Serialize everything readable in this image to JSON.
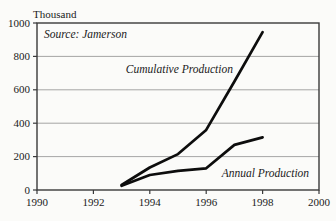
{
  "chart_data": {
    "type": "line",
    "title": "Thousand",
    "source_note": "Source: Jamerson",
    "x": [
      1993,
      1994,
      1995,
      1996,
      1997,
      1998
    ],
    "series": [
      {
        "name": "Cumulative Production",
        "values": [
          30,
          135,
          215,
          360,
          650,
          945
        ]
      },
      {
        "name": "Annual Production",
        "values": [
          25,
          90,
          115,
          130,
          270,
          315
        ]
      }
    ],
    "xlabel": "",
    "ylabel": "Thousand",
    "xlim": [
      1990,
      2000
    ],
    "ylim": [
      0,
      1000
    ],
    "x_ticks": [
      1990,
      1992,
      1994,
      1996,
      1998,
      2000
    ],
    "y_ticks": [
      0,
      200,
      400,
      600,
      800,
      1000
    ],
    "grid": "horizontal-only",
    "legend_position": "inline-annotations",
    "annotations": [
      {
        "text": "Cumulative Production",
        "x": 1995.05,
        "y": 725
      },
      {
        "text": "Annual Production",
        "x": 1998.1,
        "y": 100
      }
    ],
    "colors": {
      "line": "#0d0d0d",
      "grid": "#8f8f8f",
      "frame": "#3a3a3a",
      "text": "#1a1a1a",
      "background": "#fbfbf9"
    }
  }
}
